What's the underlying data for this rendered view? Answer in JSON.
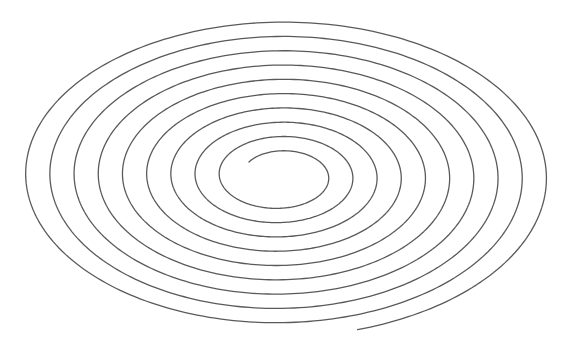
{
  "figure": {
    "type": "elliptical-archimedean-spiral",
    "background": "#ffffff",
    "stroke_color": "#5a5a5a",
    "stroke_width": 1.3,
    "center": [
      280,
      176
    ],
    "turn_spacing_x": 24.2,
    "turn_spacing_y": 14.3,
    "start_point": [
      249,
      162
    ],
    "end_point": [
      462,
      292
    ],
    "turns": 9.6,
    "direction": "clockwise"
  }
}
